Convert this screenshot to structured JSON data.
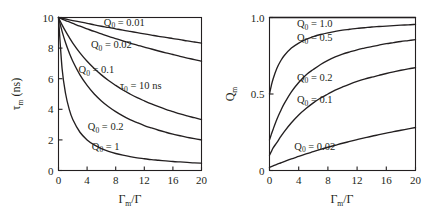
{
  "figure": {
    "background": "#ffffff",
    "ink": "#231f20"
  },
  "chart_data": [
    {
      "id": "left-panel",
      "type": "line",
      "title": "",
      "xlabel": "Γm/Γ",
      "ylabel": "τm (ns)",
      "xlim": [
        0,
        20
      ],
      "ylim": [
        0,
        10
      ],
      "xticks": [
        0,
        4,
        8,
        12,
        16,
        20
      ],
      "yticks": [
        0,
        2,
        4,
        6,
        8,
        10
      ],
      "xticklabels": [
        "0",
        "4",
        "8",
        "12",
        "16",
        "20"
      ],
      "yticklabels": [
        "0",
        "2",
        "4",
        "6",
        "8",
        "10"
      ],
      "grid": false,
      "legend_position": "inline-labels",
      "annotations": [
        {
          "text": "τ₀ = 10 ns",
          "x": 11.5,
          "y": 5.3
        }
      ],
      "x": [
        0,
        0.5,
        1,
        1.5,
        2,
        3,
        4,
        5,
        6,
        7,
        8,
        9,
        10,
        11,
        12,
        13,
        14,
        15,
        16,
        17,
        18,
        19,
        20
      ],
      "series": [
        {
          "name": "Q0 = 0.01",
          "label": "Q₀ = 0.01",
          "label_x": 9.2,
          "label_y": 9.45,
          "values": [
            10.0,
            9.95,
            9.9,
            9.85,
            9.8,
            9.71,
            9.62,
            9.52,
            9.43,
            9.35,
            9.26,
            9.17,
            9.09,
            9.01,
            8.93,
            8.85,
            8.77,
            8.7,
            8.62,
            8.55,
            8.47,
            8.4,
            8.33
          ]
        },
        {
          "name": "Q0 = 0.02",
          "label": "Q₀ = 0.02",
          "label_x": 7.4,
          "label_y": 8.0,
          "values": [
            10.0,
            9.9,
            9.8,
            9.71,
            9.62,
            9.43,
            9.26,
            9.09,
            8.93,
            8.77,
            8.62,
            8.47,
            8.33,
            8.2,
            8.06,
            7.94,
            7.81,
            7.69,
            7.58,
            7.46,
            7.35,
            7.25,
            7.14
          ]
        },
        {
          "name": "Q0 = 0.1",
          "label": "Q₀ = 0.1",
          "label_x": 5.3,
          "label_y": 6.35,
          "values": [
            10.0,
            9.52,
            9.09,
            8.7,
            8.33,
            7.69,
            7.14,
            6.67,
            6.25,
            5.88,
            5.56,
            5.26,
            5.0,
            4.76,
            4.55,
            4.35,
            4.17,
            4.0,
            3.85,
            3.7,
            3.57,
            3.45,
            3.33
          ]
        },
        {
          "name": "Q0 = 0.2",
          "label": "Q₀ = 0.2",
          "label_x": 6.6,
          "label_y": 2.62,
          "values": [
            10.0,
            9.09,
            8.33,
            7.69,
            7.14,
            6.25,
            5.56,
            5.0,
            4.55,
            4.17,
            3.85,
            3.57,
            3.33,
            3.13,
            2.94,
            2.78,
            2.63,
            2.5,
            2.38,
            2.27,
            2.17,
            2.08,
            2.0
          ]
        },
        {
          "name": "Q0 = 1",
          "label": "Q₀ = 1",
          "label_x": 6.6,
          "label_y": 1.35,
          "values": [
            10.0,
            6.67,
            5.0,
            4.0,
            3.33,
            2.5,
            2.0,
            1.67,
            1.43,
            1.25,
            1.11,
            1.0,
            0.91,
            0.83,
            0.77,
            0.71,
            0.67,
            0.63,
            0.59,
            0.56,
            0.53,
            0.5,
            0.48
          ]
        }
      ]
    },
    {
      "id": "right-panel",
      "type": "line",
      "title": "",
      "xlabel": "Γm/Γ",
      "ylabel": "Qm",
      "xlim": [
        0,
        20
      ],
      "ylim": [
        0,
        1.0
      ],
      "xticks": [
        0,
        4,
        8,
        12,
        16,
        20
      ],
      "yticks": [
        0,
        0.5,
        1.0
      ],
      "xticklabels": [
        "0",
        "4",
        "8",
        "12",
        "16",
        "20"
      ],
      "yticklabels": [
        "0",
        "0.5",
        "1.0"
      ],
      "grid": false,
      "legend_position": "inline-labels",
      "annotations": [],
      "x": [
        0,
        0.25,
        0.5,
        1,
        1.5,
        2,
        3,
        4,
        5,
        6,
        7,
        8,
        9,
        10,
        11,
        12,
        13,
        14,
        15,
        16,
        17,
        18,
        19,
        20
      ],
      "series": [
        {
          "name": "Q0 = 1.0",
          "label": "Q₀ = 1.0",
          "label_x": 6.2,
          "label_y": 0.935,
          "values": [
            1.0,
            1.0,
            1.0,
            1.0,
            1.0,
            1.0,
            1.0,
            1.0,
            1.0,
            1.0,
            1.0,
            1.0,
            1.0,
            1.0,
            1.0,
            1.0,
            1.0,
            1.0,
            1.0,
            1.0,
            1.0,
            1.0,
            1.0,
            1.0
          ]
        },
        {
          "name": "Q0 = 0.5",
          "label": "Q₀ = 0.5",
          "label_x": 6.2,
          "label_y": 0.845,
          "values": [
            0.5,
            0.555,
            0.6,
            0.667,
            0.714,
            0.75,
            0.8,
            0.833,
            0.857,
            0.875,
            0.889,
            0.9,
            0.909,
            0.917,
            0.923,
            0.929,
            0.933,
            0.938,
            0.941,
            0.944,
            0.947,
            0.95,
            0.952,
            0.955
          ]
        },
        {
          "name": "Q0 = 0.2",
          "label": "Q₀ = 0.2",
          "label_x": 6.2,
          "label_y": 0.585,
          "values": [
            0.2,
            0.236,
            0.27,
            0.333,
            0.387,
            0.435,
            0.514,
            0.575,
            0.625,
            0.66,
            0.693,
            0.72,
            0.742,
            0.76,
            0.775,
            0.789,
            0.8,
            0.81,
            0.82,
            0.829,
            0.836,
            0.843,
            0.849,
            0.855
          ]
        },
        {
          "name": "Q0 = 0.1",
          "label": "Q₀ = 0.1",
          "label_x": 6.2,
          "label_y": 0.44,
          "values": [
            0.1,
            0.124,
            0.148,
            0.182,
            0.219,
            0.253,
            0.312,
            0.363,
            0.405,
            0.442,
            0.474,
            0.5,
            0.525,
            0.546,
            0.565,
            0.582,
            0.597,
            0.61,
            0.622,
            0.634,
            0.645,
            0.655,
            0.664,
            0.672
          ]
        },
        {
          "name": "Q0 = 0.02",
          "label": "Q₀ = 0.02",
          "label_x": 6.2,
          "label_y": 0.135,
          "values": [
            0.02,
            0.025,
            0.03,
            0.04,
            0.049,
            0.058,
            0.076,
            0.092,
            0.108,
            0.123,
            0.138,
            0.152,
            0.165,
            0.178,
            0.19,
            0.202,
            0.213,
            0.224,
            0.234,
            0.244,
            0.254,
            0.263,
            0.272,
            0.281
          ]
        }
      ]
    }
  ]
}
